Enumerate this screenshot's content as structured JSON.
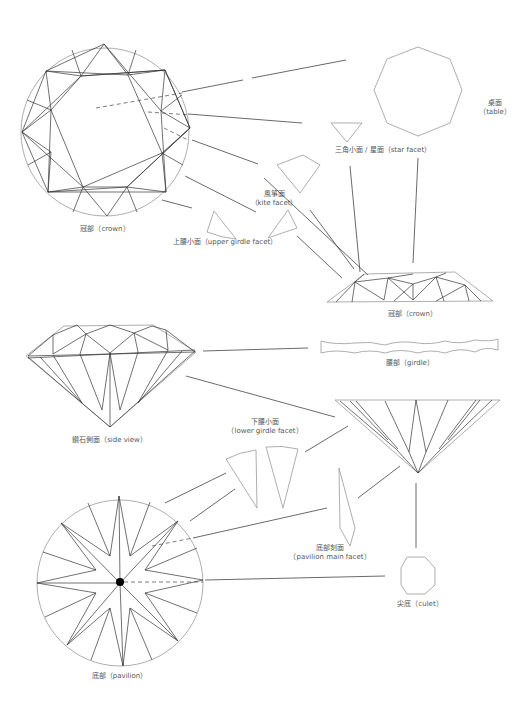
{
  "diagram": {
    "title": "",
    "colors": {
      "background": "#ffffff",
      "outline": "#999999",
      "facet_line": "#333333",
      "leader_line": "#444444",
      "label_text": "#555555"
    },
    "labels": {
      "crown_top": {
        "zh": "冠部",
        "en": "crown",
        "text": "冠部（crown）"
      },
      "table": {
        "zh": "桌面",
        "en": "table",
        "line1": "桌面",
        "line2": "（table）"
      },
      "star_facet": {
        "zh": "三角小面 / 星面",
        "en": "star facet",
        "text": "三角小面 / 星面（star facet）"
      },
      "kite_facet": {
        "zh": "風箏面",
        "en": "kite facet",
        "line1": "風箏面",
        "line2": "（kite facet）"
      },
      "upper_girdle_facet": {
        "zh": "上腰小面",
        "en": "upper girdle facet",
        "text": "上腰小面（upper girdle facet）"
      },
      "crown_side": {
        "zh": "冠部",
        "en": "crown",
        "text": "冠部（crown）"
      },
      "girdle": {
        "zh": "腰部",
        "en": "girdle",
        "text": "腰部（girdle）"
      },
      "side_view": {
        "zh": "鑽石側面",
        "en": "side view",
        "text": "鑽石側面（side view）"
      },
      "lower_girdle_facet": {
        "zh": "下腰小面",
        "en": "lower girdle facet",
        "line1": "下腰小面",
        "line2": "（lower girdle facet）"
      },
      "pavilion_main_facet": {
        "zh": "底部刻面",
        "en": "pavilion main facet",
        "line1": "底部刻面",
        "line2": "（pavilion main facet）"
      },
      "culet": {
        "zh": "尖底",
        "en": "culet",
        "text": "尖底（culet）"
      },
      "pavilion": {
        "zh": "底部",
        "en": "pavilion",
        "text": "底部（pavilion）"
      }
    },
    "components": [
      "crown-top-view",
      "table-octagon",
      "star-facet-triangle",
      "kite-facet-shape",
      "upper-girdle-facets",
      "crown-side-profile",
      "girdle-strip",
      "diamond-side-view",
      "pavilion-side-profile",
      "lower-girdle-facets",
      "pavilion-main-facet-shape",
      "culet-octagon",
      "pavilion-bottom-view"
    ]
  }
}
